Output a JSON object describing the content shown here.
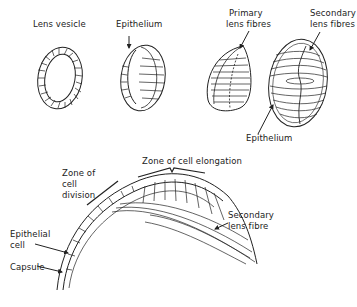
{
  "figure": {
    "top_panel": {
      "stages": [
        {
          "name": "lens-vesicle",
          "label": "Lens vesicle"
        },
        {
          "name": "epithelium-stage",
          "label": "Epithelium"
        },
        {
          "name": "primary-fibres-stage",
          "label": "Primary\nlens fibres",
          "label_lines": [
            "Primary",
            "lens fibres"
          ]
        },
        {
          "name": "secondary-fibres-stage",
          "label_lines": [
            "Secondary",
            "lens fibres"
          ],
          "bottom_label": "Epithelium"
        }
      ]
    },
    "bottom_panel": {
      "labels": {
        "zone_division": [
          "Zone of",
          "cell",
          "division"
        ],
        "zone_elongation": "Zone of cell elongation",
        "epithelial_cell": [
          "Epithelial",
          "cell"
        ],
        "capsule": "Capsule",
        "secondary_fibre": [
          "Secondary",
          "lens fibre"
        ]
      }
    },
    "colors": {
      "ink": "#222222",
      "background": "#ffffff"
    }
  }
}
